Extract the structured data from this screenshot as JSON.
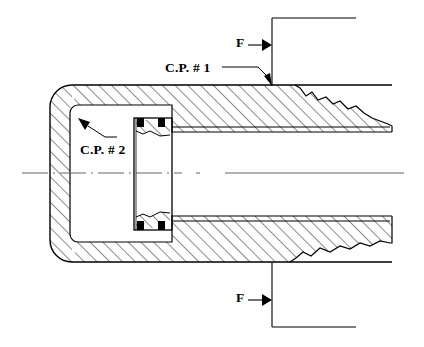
{
  "figure": {
    "type": "engineering-cross-section-drawing",
    "background_color": "#ffffff",
    "line_color": "#000000",
    "hatch_color": "#000000"
  },
  "labels": {
    "contact_point_1": "C.P. # 1",
    "contact_point_2": "C.P. # 2",
    "force_top": "F",
    "force_bottom": "F"
  },
  "icons": {
    "leader_arrow_cp1": "arrow-down-right-icon",
    "leader_arrow_cp2": "arrow-up-left-icon",
    "force_arrow_top": "arrow-right-icon",
    "force_arrow_bottom": "arrow-right-icon"
  },
  "geometry": {
    "centerline_y": 173,
    "housing": {
      "outer_left_x": 50,
      "outer_top_y": 85,
      "outer_bottom_y": 262,
      "corner_radius": 22,
      "wall_thickness": 20
    },
    "seal": {
      "left_x": 134,
      "right_x": 172,
      "top_y": 118,
      "bottom_y": 230
    },
    "shaft": {
      "top_y": 127,
      "bottom_y": 221,
      "right_x": 390
    },
    "force_line_top_y": 18,
    "force_line_bottom_y": 327,
    "force_vertical_x": 272
  }
}
